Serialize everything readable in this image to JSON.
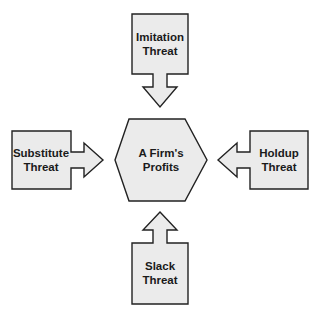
{
  "diagram": {
    "type": "threat-diagram",
    "center": {
      "line1": "A Firm's",
      "line2": "Profits",
      "shape": "hexagon"
    },
    "nodes": [
      {
        "id": "imitation",
        "position": "top",
        "line1": "Imitation",
        "line2": "Threat",
        "arrow": "down-toward-center"
      },
      {
        "id": "substitute",
        "position": "left",
        "line1": "Substitute",
        "line2": "Threat",
        "arrow": "right-toward-center"
      },
      {
        "id": "holdup",
        "position": "right",
        "line1": "Holdup",
        "line2": "Threat",
        "arrow": "left-toward-center"
      },
      {
        "id": "slack",
        "position": "bottom",
        "line1": "Slack",
        "line2": "Threat",
        "arrow": "up-toward-center"
      }
    ],
    "colors": {
      "fill": "#ebebeb",
      "stroke": "#222222",
      "text": "#1a1a1a"
    }
  }
}
